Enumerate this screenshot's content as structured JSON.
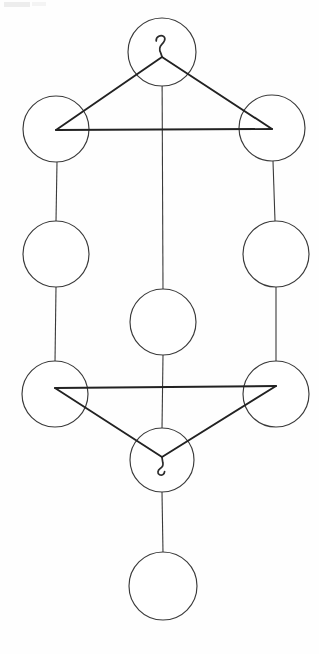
{
  "diagram": {
    "type": "sephirothic-tree",
    "background_color": "#fefefe",
    "stroke_color": "#3a3a3a",
    "triangle_stroke_color": "#222222",
    "node_fill_color": "#ffffff",
    "node_count": 10,
    "nodes": [
      {
        "id": "node-top-center",
        "label": "",
        "cx": 162,
        "cy": 52,
        "r": 34,
        "row": 1,
        "column": "center"
      },
      {
        "id": "node-upper-left",
        "label": "",
        "cx": 56,
        "cy": 129,
        "r": 33,
        "row": 2,
        "column": "left"
      },
      {
        "id": "node-upper-right",
        "label": "",
        "cx": 272,
        "cy": 128,
        "r": 33,
        "row": 2,
        "column": "right"
      },
      {
        "id": "node-middle-left",
        "label": "",
        "cx": 56,
        "cy": 254,
        "r": 33,
        "row": 3,
        "column": "left"
      },
      {
        "id": "node-middle-right",
        "label": "",
        "cx": 276,
        "cy": 254,
        "r": 33,
        "row": 3,
        "column": "right"
      },
      {
        "id": "node-center",
        "label": "",
        "cx": 163,
        "cy": 322,
        "r": 33,
        "row": 4,
        "column": "center"
      },
      {
        "id": "node-lower-left",
        "label": "",
        "cx": 55,
        "cy": 394,
        "r": 33,
        "row": 5,
        "column": "left"
      },
      {
        "id": "node-lower-right",
        "label": "",
        "cx": 276,
        "cy": 394,
        "r": 33,
        "row": 5,
        "column": "right"
      },
      {
        "id": "node-foundation",
        "label": "",
        "cx": 162,
        "cy": 460,
        "r": 32,
        "row": 6,
        "column": "center"
      },
      {
        "id": "node-bottom-center",
        "label": "",
        "cx": 163,
        "cy": 586,
        "r": 34,
        "row": 7,
        "column": "center"
      }
    ],
    "triangles": [
      {
        "id": "upper-triangle",
        "orientation": "point-up",
        "points": "162,57 56,130 272,129",
        "vertices": [
          "node-top-center",
          "node-upper-left",
          "node-upper-right"
        ]
      },
      {
        "id": "lower-triangle",
        "orientation": "point-down",
        "points": "55,388 276,386 162,457",
        "vertices": [
          "node-lower-left",
          "node-lower-right",
          "node-foundation"
        ]
      }
    ],
    "connectors": [
      {
        "id": "connector-center-spine-upper",
        "x1": 162,
        "y1": 57,
        "x2": 163,
        "y2": 290
      },
      {
        "id": "connector-center-spine-lower",
        "x1": 163,
        "y1": 355,
        "x2": 162,
        "y2": 429
      },
      {
        "id": "connector-foundation-to-bottom",
        "x1": 162,
        "y1": 492,
        "x2": 163,
        "y2": 553
      },
      {
        "id": "connector-left-pillar-upper",
        "x1": 57,
        "y1": 162,
        "x2": 56,
        "y2": 221
      },
      {
        "id": "connector-left-pillar-lower",
        "x1": 56,
        "y1": 287,
        "x2": 55,
        "y2": 362
      },
      {
        "id": "connector-right-pillar-upper",
        "x1": 273,
        "y1": 161,
        "x2": 275,
        "y2": 221
      },
      {
        "id": "connector-right-pillar-lower",
        "x1": 276,
        "y1": 287,
        "x2": 276,
        "y2": 362
      }
    ],
    "glyphs": [
      {
        "id": "glyph-top-hook",
        "name": "yod-hook-mark",
        "description": "small hook / question-mark stroke inside the topmost circle, curl opening left, tail descending",
        "cx": 162,
        "cy": 45,
        "orientation": "upright"
      },
      {
        "id": "glyph-foundation-hook",
        "name": "yod-hook-mark",
        "description": "small hook stroke inside the foundation circle, tail descending then curling right",
        "cx": 163,
        "cy": 466,
        "orientation": "inverted"
      }
    ],
    "artifacts": [
      {
        "id": "scan-smudge-top-left",
        "x": 4,
        "y": 2,
        "width": 26,
        "height": 5,
        "color": "#ededed"
      },
      {
        "id": "scan-smudge-top-left-2",
        "x": 32,
        "y": 2,
        "width": 14,
        "height": 4,
        "color": "#f4f4f4"
      }
    ]
  }
}
